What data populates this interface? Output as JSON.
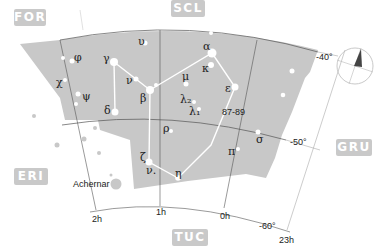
{
  "map": {
    "constellation": "Phoenix",
    "colors": {
      "constellation_fill": "#c8c8c8",
      "background": "#ffffff",
      "star": "#ffffff",
      "lines": "#ffffff",
      "grid": "#555555",
      "neighbor_label_bg": "#c9c9c9"
    },
    "neighbors": [
      {
        "abbr": "FOR",
        "x": 14,
        "y": 9,
        "w": 32
      },
      {
        "abbr": "SCL",
        "x": 171,
        "y": 0,
        "w": 34
      },
      {
        "abbr": "ERI",
        "x": 14,
        "y": 168,
        "w": 34
      },
      {
        "abbr": "GRU",
        "x": 336,
        "y": 139,
        "w": 36
      },
      {
        "abbr": "TUC",
        "x": 172,
        "y": 229,
        "w": 36
      }
    ],
    "ra_labels": [
      {
        "text": "2h",
        "x": 92,
        "y": 222
      },
      {
        "text": "1h",
        "x": 156,
        "y": 215
      },
      {
        "text": "0h",
        "x": 220,
        "y": 219
      },
      {
        "text": "23h",
        "x": 279,
        "y": 243
      }
    ],
    "dec_labels": [
      {
        "text": "-40°",
        "x": 316,
        "y": 60
      },
      {
        "text": "-50°",
        "x": 290,
        "y": 145
      },
      {
        "text": "-60°",
        "x": 259,
        "y": 229
      }
    ],
    "star_labels": [
      {
        "text": "φ",
        "x": 74,
        "y": 61
      },
      {
        "text": "υ",
        "x": 138,
        "y": 45
      },
      {
        "text": "γ",
        "x": 103,
        "y": 62
      },
      {
        "text": "α",
        "x": 203,
        "y": 50
      },
      {
        "text": "χ",
        "x": 56,
        "y": 86
      },
      {
        "text": "ν",
        "x": 126,
        "y": 84
      },
      {
        "text": "κ",
        "x": 202,
        "y": 72
      },
      {
        "text": "μ",
        "x": 182,
        "y": 80
      },
      {
        "text": "ψ",
        "x": 82,
        "y": 100
      },
      {
        "text": "β",
        "x": 140,
        "y": 102
      },
      {
        "text": "ε",
        "x": 225,
        "y": 92
      },
      {
        "text": "λ₂",
        "x": 180,
        "y": 103
      },
      {
        "text": "λ₁",
        "x": 189,
        "y": 115
      },
      {
        "text": "δ",
        "x": 104,
        "y": 114
      },
      {
        "text": "87-89",
        "x": 222,
        "y": 115
      },
      {
        "text": "ρ",
        "x": 163,
        "y": 132
      },
      {
        "text": "π",
        "x": 228,
        "y": 155
      },
      {
        "text": "σ",
        "x": 256,
        "y": 143
      },
      {
        "text": "ζ",
        "x": 140,
        "y": 161
      },
      {
        "text": "ν.",
        "x": 146,
        "y": 174
      },
      {
        "text": "η",
        "x": 175,
        "y": 177
      }
    ],
    "named_stars": [
      {
        "text": "Achernar",
        "x": 73,
        "y": 187
      }
    ],
    "stars": [
      {
        "id": "alpha",
        "x": 212,
        "y": 53,
        "r": 4.5
      },
      {
        "id": "beta",
        "x": 150,
        "y": 90,
        "r": 4
      },
      {
        "id": "beta2",
        "x": 156,
        "y": 85,
        "r": 2
      },
      {
        "id": "gamma",
        "x": 114,
        "y": 62,
        "r": 4
      },
      {
        "id": "delta",
        "x": 115,
        "y": 112,
        "r": 3.5
      },
      {
        "id": "epsilon",
        "x": 235,
        "y": 87,
        "r": 3.5
      },
      {
        "id": "kappa",
        "x": 211,
        "y": 65,
        "r": 3
      },
      {
        "id": "zeta",
        "x": 149,
        "y": 162,
        "r": 3.5
      },
      {
        "id": "eta",
        "x": 178,
        "y": 178,
        "r": 2.8
      },
      {
        "id": "phi",
        "x": 72,
        "y": 61,
        "r": 2.5
      },
      {
        "id": "phi2",
        "x": 63,
        "y": 58,
        "r": 2
      },
      {
        "id": "upsilon",
        "x": 145,
        "y": 43,
        "r": 2.5
      },
      {
        "id": "chi",
        "x": 65,
        "y": 80,
        "r": 2
      },
      {
        "id": "nu",
        "x": 136,
        "y": 79,
        "r": 2.5
      },
      {
        "id": "mu",
        "x": 186,
        "y": 84,
        "r": 2.5
      },
      {
        "id": "psi",
        "x": 78,
        "y": 94,
        "r": 2.5
      },
      {
        "id": "psi2",
        "x": 76,
        "y": 104,
        "r": 2
      },
      {
        "id": "lambda2",
        "x": 194,
        "y": 102,
        "r": 2
      },
      {
        "id": "lambda1",
        "x": 199,
        "y": 109,
        "r": 2
      },
      {
        "id": "rho",
        "x": 171,
        "y": 131,
        "r": 2
      },
      {
        "id": "pi",
        "x": 238,
        "y": 149,
        "r": 2
      },
      {
        "id": "sigma",
        "x": 258,
        "y": 132,
        "r": 2.5
      },
      {
        "id": "iota",
        "x": 292,
        "y": 71,
        "r": 2.5
      },
      {
        "id": "s2",
        "x": 283,
        "y": 95,
        "r": 2.3
      },
      {
        "id": "top1",
        "x": 211,
        "y": 33,
        "r": 2
      },
      {
        "id": "top2",
        "x": 247,
        "y": 34,
        "r": 1.5
      }
    ],
    "outer_stars": [
      {
        "id": "achernar",
        "x": 116,
        "y": 184,
        "r": 5.5
      },
      {
        "id": "o1",
        "x": 57,
        "y": 145,
        "r": 2.5
      },
      {
        "id": "o2",
        "x": 84,
        "y": 139,
        "r": 2.5
      },
      {
        "id": "o3",
        "x": 99,
        "y": 153,
        "r": 2
      },
      {
        "id": "o4",
        "x": 111,
        "y": 175,
        "r": 1.5
      },
      {
        "id": "o5",
        "x": 34,
        "y": 116,
        "r": 2
      },
      {
        "id": "o6",
        "x": 95,
        "y": 128,
        "r": 2
      }
    ]
  }
}
